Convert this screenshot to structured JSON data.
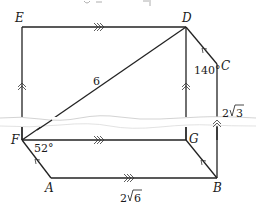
{
  "diagram": {
    "type": "geometry-figure",
    "vertices": [
      {
        "id": "E",
        "label": "E",
        "x": 22,
        "y": 27
      },
      {
        "id": "D",
        "label": "D",
        "x": 186,
        "y": 27
      },
      {
        "id": "C",
        "label": "C",
        "x": 217,
        "y": 64
      },
      {
        "id": "B",
        "label": "B",
        "x": 217,
        "y": 178
      },
      {
        "id": "A",
        "label": "A",
        "x": 51,
        "y": 178
      },
      {
        "id": "F",
        "label": "F",
        "x": 22,
        "y": 140
      },
      {
        "id": "G",
        "label": "G",
        "x": 186,
        "y": 140
      }
    ],
    "edges": [
      {
        "from": "E",
        "to": "D",
        "marker": "triple-arrow"
      },
      {
        "from": "E",
        "to": "F",
        "marker": "double-arrow"
      },
      {
        "from": "D",
        "to": "G",
        "marker": "double-arrow"
      },
      {
        "from": "D",
        "to": "C",
        "marker": "single-arrow"
      },
      {
        "from": "C",
        "to": "B",
        "marker": "double-arrow"
      },
      {
        "from": "F",
        "to": "G",
        "marker": "triple-arrow"
      },
      {
        "from": "F",
        "to": "A",
        "marker": "single-arrow"
      },
      {
        "from": "A",
        "to": "B",
        "marker": "triple-arrow"
      },
      {
        "from": "G",
        "to": "B",
        "marker": "single-arrow"
      },
      {
        "from": "F",
        "to": "D",
        "marker": "none"
      }
    ],
    "measurements": {
      "FD_length": "6",
      "CB_length": "2√3",
      "AB_length": "2√6",
      "angle_C": "140°",
      "angle_F": "52°"
    },
    "labels": {
      "E": "E",
      "D": "D",
      "C": "C",
      "B": "B",
      "A": "A",
      "F": "F",
      "G": "G",
      "fd": "6",
      "cb_coef": "2",
      "cb_rad": "3",
      "ab_coef": "2",
      "ab_rad": "6",
      "angle_c": "140°",
      "angle_f": "52°"
    }
  }
}
